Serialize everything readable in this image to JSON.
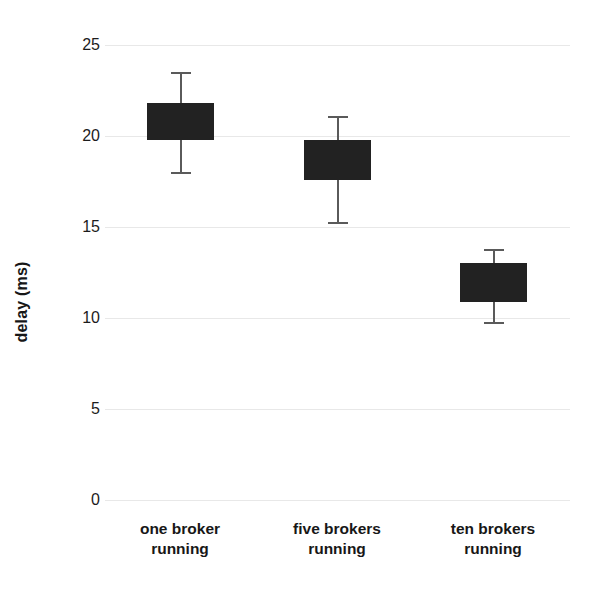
{
  "chart_data": {
    "type": "bar",
    "subtype": "box-plot-with-error-bars",
    "title": "",
    "xlabel": "",
    "ylabel": "delay (ms)",
    "ylim": [
      0,
      25
    ],
    "yticks": [
      0,
      5,
      10,
      15,
      20,
      25
    ],
    "ytick_labels": [
      "0",
      "5",
      "10",
      "15",
      "20",
      "25"
    ],
    "grid": true,
    "grid_axis": "y",
    "legend": false,
    "legend_position": "none",
    "categories": [
      "one broker\nrunning",
      "five brokers\nrunning",
      "ten brokers\nrunning"
    ],
    "category_lines": [
      [
        "one broker",
        "running"
      ],
      [
        "five brokers",
        "running"
      ],
      [
        "ten brokers",
        "running"
      ]
    ],
    "series": [
      {
        "name": "delay",
        "box_top": [
          21.8,
          19.8,
          13.0
        ],
        "box_bottom": [
          19.8,
          17.6,
          10.9
        ],
        "whisker_high": [
          23.5,
          21.1,
          13.8
        ],
        "whisker_low": [
          18.0,
          15.3,
          9.8
        ],
        "values": [
          20.8,
          18.7,
          11.9
        ]
      }
    ],
    "colors": {
      "box_fill": "#222222",
      "whisker": "#5a5a5a",
      "gridline": "#e8e8e8",
      "text": "#171717",
      "background": "#ffffff"
    }
  }
}
